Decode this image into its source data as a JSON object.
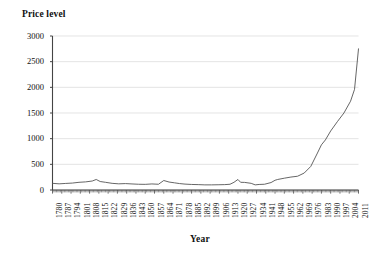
{
  "chart_data": {
    "type": "line",
    "title": "",
    "ylabel": "Price level",
    "xlabel": "Year",
    "xlim": [
      1780,
      2011
    ],
    "ylim": [
      0,
      3000
    ],
    "grid": true,
    "legend": null,
    "y_ticks": [
      0,
      500,
      1000,
      1500,
      2000,
      2500,
      3000
    ],
    "y_tick_labels": [
      "0",
      "500",
      "1000",
      "1500",
      "2000",
      "2500",
      "3000"
    ],
    "x_tick_labels": [
      "1780",
      "1787",
      "1794",
      "1801",
      "1808",
      "1815",
      "1822",
      "1829",
      "1836",
      "1843",
      "1850",
      "1857",
      "1864",
      "1871",
      "1878",
      "1885",
      "1892",
      "1899",
      "1906",
      "1913",
      "1920",
      "1927",
      "1934",
      "1941",
      "1948",
      "1955",
      "1962",
      "1969",
      "1976",
      "1983",
      "1990",
      "1997",
      "2004",
      "2011"
    ],
    "x_tick_step": 7,
    "series": [
      {
        "name": "Price level",
        "color": "#555555",
        "x": [
          1780,
          1785,
          1790,
          1795,
          1800,
          1805,
          1810,
          1813,
          1816,
          1820,
          1825,
          1830,
          1835,
          1840,
          1845,
          1850,
          1855,
          1860,
          1864,
          1868,
          1872,
          1876,
          1880,
          1885,
          1890,
          1895,
          1900,
          1905,
          1910,
          1914,
          1917,
          1920,
          1922,
          1925,
          1930,
          1933,
          1936,
          1940,
          1945,
          1948,
          1950,
          1955,
          1960,
          1965,
          1970,
          1975,
          1980,
          1983,
          1986,
          1990,
          1995,
          2000,
          2005,
          2008,
          2011
        ],
        "y": [
          130,
          120,
          128,
          135,
          150,
          158,
          175,
          205,
          165,
          150,
          130,
          120,
          125,
          118,
          112,
          110,
          118,
          112,
          185,
          155,
          140,
          125,
          115,
          108,
          105,
          100,
          100,
          102,
          105,
          112,
          150,
          205,
          150,
          148,
          130,
          100,
          108,
          112,
          145,
          190,
          205,
          230,
          252,
          268,
          330,
          460,
          720,
          880,
          975,
          1150,
          1330,
          1500,
          1730,
          1960,
          2750
        ]
      }
    ],
    "annotations": []
  },
  "axis_style": {
    "gridline_color": "#d9d9d9",
    "axis_color": "#444444",
    "line_color": "#555555",
    "background": "#ffffff"
  }
}
